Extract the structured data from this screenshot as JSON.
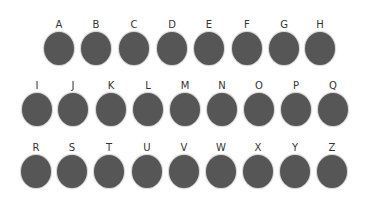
{
  "colors": {
    "dot": "#565656",
    "label": "#333333",
    "background": "#ffffff"
  },
  "rows": [
    {
      "keys": [
        {
          "label": "A",
          "x": 44
        },
        {
          "label": "B",
          "x": 81
        },
        {
          "label": "C",
          "x": 119
        },
        {
          "label": "D",
          "x": 157
        },
        {
          "label": "E",
          "x": 194
        },
        {
          "label": "F",
          "x": 232
        },
        {
          "label": "G",
          "x": 269
        },
        {
          "label": "H",
          "x": 305
        }
      ],
      "y": 19
    },
    {
      "keys": [
        {
          "label": "I",
          "x": 22
        },
        {
          "label": "J",
          "x": 58
        },
        {
          "label": "K",
          "x": 96
        },
        {
          "label": "L",
          "x": 133
        },
        {
          "label": "M",
          "x": 170
        },
        {
          "label": "N",
          "x": 207
        },
        {
          "label": "O",
          "x": 244
        },
        {
          "label": "P",
          "x": 281
        },
        {
          "label": "Q",
          "x": 318
        }
      ],
      "y": 80
    },
    {
      "keys": [
        {
          "label": "R",
          "x": 21
        },
        {
          "label": "S",
          "x": 57
        },
        {
          "label": "T",
          "x": 94
        },
        {
          "label": "U",
          "x": 132
        },
        {
          "label": "V",
          "x": 169
        },
        {
          "label": "W",
          "x": 206
        },
        {
          "label": "X",
          "x": 243
        },
        {
          "label": "Y",
          "x": 280
        },
        {
          "label": "Z",
          "x": 317
        }
      ],
      "y": 142
    }
  ]
}
